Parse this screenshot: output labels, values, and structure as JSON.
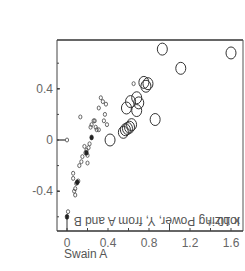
{
  "chart_data": {
    "type": "scatter",
    "title": "",
    "xlabel": "Swain A",
    "ylabel": "Ionizing Power, Y, from A and B",
    "ylabel_multiplier": "x 10⁻¹",
    "xlim": [
      -0.1,
      1.72
    ],
    "ylim": [
      -0.7,
      0.78
    ],
    "xticks": [
      0,
      0.4,
      0.8,
      1.2,
      1.6
    ],
    "xtick_labels": [
      "0",
      "0.4",
      "0.8",
      "1.2",
      "1.6"
    ],
    "yticks": [
      -0.4,
      0,
      0.4
    ],
    "ytick_labels": [
      "-0.4",
      "0",
      "0.4"
    ],
    "grid": false,
    "legend": null,
    "series": [
      {
        "name": "small open circles (from A)",
        "marker": "small-open-circle",
        "points": [
          [
            0.0,
            0.0
          ],
          [
            0.01,
            -0.56
          ],
          [
            0.06,
            -0.3
          ],
          [
            0.06,
            -0.26
          ],
          [
            0.07,
            -0.4
          ],
          [
            0.08,
            -0.43
          ],
          [
            0.08,
            -0.38
          ],
          [
            0.09,
            -0.34
          ],
          [
            0.1,
            -0.33
          ],
          [
            0.11,
            -0.32
          ],
          [
            0.12,
            -0.2
          ],
          [
            0.13,
            0.18
          ],
          [
            0.14,
            -0.17
          ],
          [
            0.15,
            -0.13
          ],
          [
            0.17,
            -0.05
          ],
          [
            0.18,
            -0.1
          ],
          [
            0.19,
            -0.08
          ],
          [
            0.2,
            -0.12
          ],
          [
            0.2,
            -0.18
          ],
          [
            0.21,
            -0.06
          ],
          [
            0.22,
            -0.03
          ],
          [
            0.23,
            0.1
          ],
          [
            0.24,
            0.12
          ],
          [
            0.26,
            0.15
          ],
          [
            0.27,
            0.15
          ],
          [
            0.28,
            0.1
          ],
          [
            0.29,
            0.08
          ],
          [
            0.31,
            0.08
          ],
          [
            0.31,
            0.25
          ],
          [
            0.33,
            0.33
          ],
          [
            0.35,
            0.3
          ],
          [
            0.36,
            0.15
          ],
          [
            0.37,
            0.2
          ],
          [
            0.38,
            0.28
          ],
          [
            0.39,
            0.12
          ],
          [
            0.65,
            0.44
          ]
        ]
      },
      {
        "name": "filled points",
        "marker": "small-filled",
        "points": [
          [
            0.0,
            -0.6
          ],
          [
            0.1,
            -0.33
          ],
          [
            0.24,
            0.02
          ],
          [
            0.19,
            -0.1
          ]
        ]
      },
      {
        "name": "large open circles (from B)",
        "marker": "large-open-circle",
        "points": [
          [
            0.42,
            0.0
          ],
          [
            0.55,
            0.06
          ],
          [
            0.57,
            0.08
          ],
          [
            0.59,
            0.09
          ],
          [
            0.61,
            0.1
          ],
          [
            0.63,
            0.12
          ],
          [
            0.58,
            0.25
          ],
          [
            0.62,
            0.3
          ],
          [
            0.68,
            0.23
          ],
          [
            0.68,
            0.33
          ],
          [
            0.7,
            0.29
          ],
          [
            0.75,
            0.45
          ],
          [
            0.77,
            0.42
          ],
          [
            0.79,
            0.44
          ],
          [
            0.86,
            0.16
          ],
          [
            0.93,
            0.71
          ],
          [
            1.11,
            0.56
          ],
          [
            1.6,
            0.68
          ]
        ]
      }
    ]
  },
  "labels": {
    "xlabel": "Swain A",
    "ylabel": "Ionizing Power, Y, from A and B",
    "ymult": "x 10⁻¹"
  }
}
